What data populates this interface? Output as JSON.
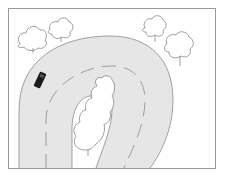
{
  "illustration": {
    "subject": "hairpin-bend road with car and trees",
    "colors": {
      "background": "#ffffff",
      "road": "#e6e6e6",
      "road_edge": "#8a8a8a",
      "lane_marking": "#8a8a8a",
      "frame": "#9a9a9a",
      "tree_outline": "#777777",
      "car": "#1a1a1a"
    },
    "elements": {
      "car": "car-icon",
      "trees": 5
    }
  }
}
